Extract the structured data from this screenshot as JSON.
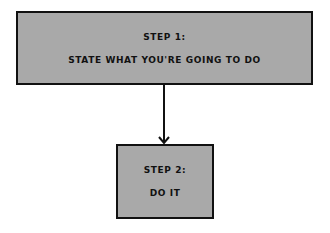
{
  "diagram": {
    "steps": [
      {
        "title": "STEP 1:",
        "text": "STATE WHAT YOU'RE GOING TO DO"
      },
      {
        "title": "STEP 2:",
        "text": "DO IT"
      }
    ],
    "edges": [
      {
        "from": 0,
        "to": 1,
        "type": "arrow"
      }
    ],
    "colors": {
      "box_fill": "#a9a9a9",
      "stroke": "#111111",
      "background": "#ffffff"
    }
  }
}
